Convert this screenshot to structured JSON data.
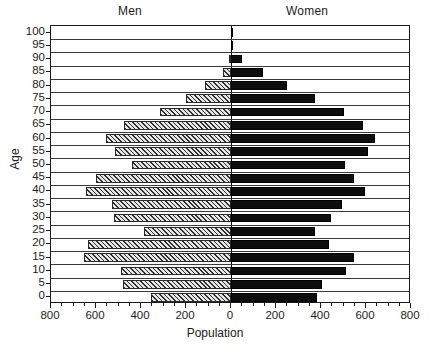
{
  "chart_data": {
    "type": "bar",
    "subtype": "population-pyramid",
    "title": "",
    "xlabel": "Population",
    "ylabel": "Age",
    "grid": true,
    "legend_position": "top",
    "xlim": [
      -800,
      800
    ],
    "x_tick_labels": [
      "800",
      "600",
      "400",
      "200",
      "0",
      "200",
      "400",
      "600",
      "800"
    ],
    "x_tick_values": [
      -800,
      -600,
      -400,
      -200,
      0,
      200,
      400,
      600,
      800
    ],
    "x_minor_step": 50,
    "categories": [
      "0",
      "5",
      "10",
      "15",
      "20",
      "25",
      "30",
      "35",
      "40",
      "45",
      "50",
      "55",
      "60",
      "65",
      "70",
      "75",
      "80",
      "85",
      "90",
      "95",
      "100"
    ],
    "y_tick_labels": [
      "0",
      "5",
      "10",
      "15",
      "20",
      "25",
      "30",
      "35",
      "40",
      "45",
      "50",
      "55",
      "60",
      "65",
      "70",
      "75",
      "80",
      "85",
      "90",
      "95",
      "100"
    ],
    "series": [
      {
        "name": "Men",
        "side": "left",
        "fill": "diagonal-hatch",
        "values": [
          355,
          480,
          490,
          655,
          635,
          385,
          520,
          530,
          645,
          600,
          440,
          515,
          555,
          475,
          315,
          200,
          115,
          35,
          10,
          2,
          1
        ]
      },
      {
        "name": "Women",
        "side": "right",
        "fill": "solid-black",
        "values": [
          380,
          405,
          510,
          545,
          435,
          375,
          445,
          495,
          595,
          545,
          505,
          610,
          640,
          585,
          500,
          375,
          250,
          140,
          50,
          4,
          2
        ]
      }
    ],
    "annotations": []
  },
  "legend": {
    "men_label": "Men",
    "women_label": "Women"
  },
  "axes": {
    "x_title": "Population",
    "y_title": "Age"
  },
  "colors": {
    "women_bar": "#0d0d0d",
    "men_bar_base": "#d8d8d8",
    "men_bar_hatch": "#2f2f2f",
    "axis": "#1a1a1a",
    "gridline": "#3a3a3a",
    "background": "#ffffff"
  }
}
